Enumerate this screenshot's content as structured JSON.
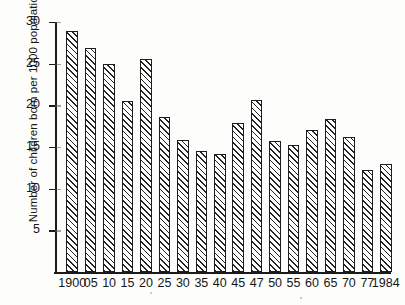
{
  "chart_data": {
    "type": "bar",
    "title": "",
    "subtitle": "",
    "xlabel": "",
    "ylabel": "Number of children born per 1000 population",
    "categories": [
      "1900",
      "05",
      "10",
      "15",
      "20",
      "25",
      "30",
      "35",
      "40",
      "45",
      "47",
      "50",
      "55",
      "60",
      "65",
      "70",
      "77",
      "1984"
    ],
    "values": [
      28.9,
      26.9,
      25.0,
      20.5,
      25.6,
      18.6,
      15.9,
      14.5,
      14.2,
      17.9,
      20.6,
      15.7,
      15.2,
      17.0,
      18.4,
      16.2,
      12.2,
      13.0
    ],
    "ylim": [
      0,
      30
    ],
    "ytick_labels": [
      "5",
      "10",
      "15",
      "20",
      "25",
      "30"
    ],
    "ytick_values": [
      5,
      10,
      15,
      20,
      25,
      30
    ],
    "grid": false,
    "legend": [],
    "legend_position": "none",
    "annotations": [],
    "colors": {
      "bar_edge": "#1d1d1d",
      "bar_hatch": "#232323",
      "bar_fill": "#fefefe",
      "axis": "#1b1b1b",
      "text": "#161616",
      "background": "#fdfdfb"
    }
  }
}
